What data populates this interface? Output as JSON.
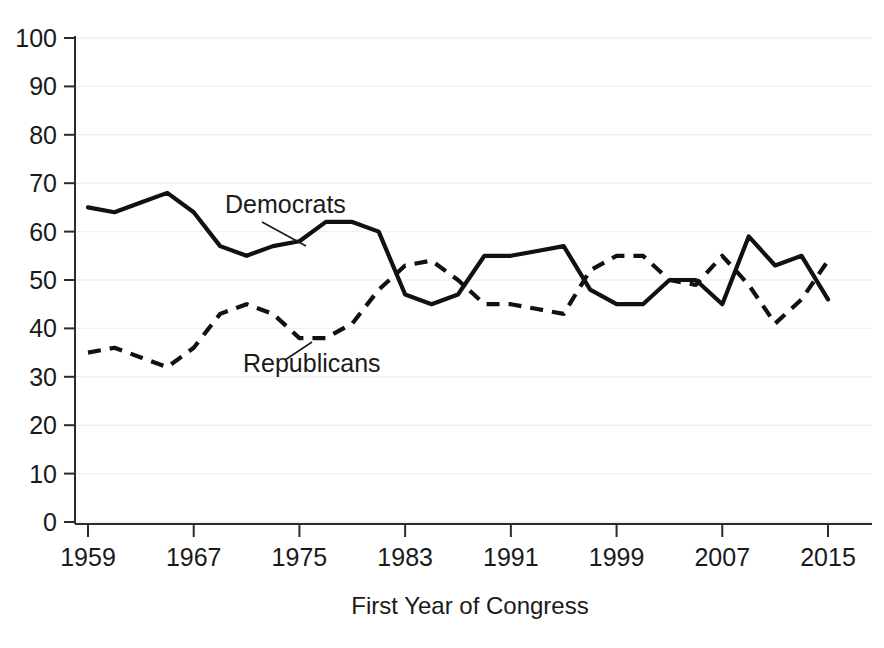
{
  "chart_data": {
    "type": "line",
    "title": "",
    "xlabel": "First Year of Congress",
    "ylabel": "",
    "xlim": [
      1959,
      2015
    ],
    "ylim": [
      0,
      100
    ],
    "grid": true,
    "legend_position": "inline-annotations",
    "x": [
      1959,
      1961,
      1963,
      1965,
      1967,
      1969,
      1971,
      1973,
      1975,
      1977,
      1979,
      1981,
      1983,
      1985,
      1987,
      1989,
      1991,
      1993,
      1995,
      1997,
      1999,
      2001,
      2003,
      2005,
      2007,
      2009,
      2011,
      2013,
      2015
    ],
    "xticks": [
      1959,
      1967,
      1975,
      1983,
      1991,
      1999,
      2007,
      2015
    ],
    "yticks": [
      0,
      10,
      20,
      30,
      40,
      50,
      60,
      70,
      80,
      90,
      100
    ],
    "series": [
      {
        "name": "Democrats",
        "style": "solid",
        "color": "#111111",
        "values": [
          65,
          64,
          66,
          68,
          64,
          57,
          55,
          57,
          58,
          62,
          62,
          60,
          47,
          45,
          47,
          55,
          55,
          56,
          57,
          48,
          45,
          45,
          50,
          50,
          45,
          59,
          53,
          55,
          46
        ]
      },
      {
        "name": "Republicans",
        "style": "dashed",
        "color": "#111111",
        "values": [
          35,
          36,
          34,
          32,
          36,
          43,
          45,
          43,
          38,
          38,
          41,
          48,
          53,
          54,
          50,
          45,
          45,
          44,
          43,
          52,
          55,
          55,
          50,
          49,
          55,
          49,
          41,
          46,
          54
        ]
      }
    ],
    "annotations": [
      {
        "name": "Democrats",
        "label": "Democrats",
        "label_x": 225,
        "label_y": 213,
        "leader_from_x": 262,
        "leader_from_y": 222,
        "leader_to_x": 306,
        "leader_to_y": 246
      },
      {
        "name": "Republicans",
        "label": "Republicans",
        "label_x": 243,
        "label_y": 372,
        "leader_from_x": 285,
        "leader_from_y": 360,
        "leader_to_x": 312,
        "leader_to_y": 342
      }
    ]
  },
  "axes": {
    "x_title": "First Year of Congress",
    "x_tick_labels": [
      "1959",
      "1967",
      "1975",
      "1983",
      "1991",
      "1999",
      "2007",
      "2015"
    ],
    "y_tick_labels": [
      "0",
      "10",
      "20",
      "30",
      "40",
      "50",
      "60",
      "70",
      "80",
      "90",
      "100"
    ]
  }
}
